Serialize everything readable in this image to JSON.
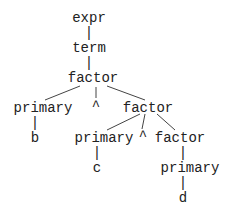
{
  "diagram": {
    "type": "parse-tree",
    "line_color": "#444444",
    "text_color": "#222222",
    "nodes": [
      {
        "id": "n0",
        "label": "expr",
        "x": 89,
        "y": 11
      },
      {
        "id": "n1",
        "label": "|",
        "x": 89,
        "y": 26
      },
      {
        "id": "n2",
        "label": "term",
        "x": 89,
        "y": 41
      },
      {
        "id": "n3",
        "label": "|",
        "x": 89,
        "y": 56
      },
      {
        "id": "n4",
        "label": "factor",
        "x": 93,
        "y": 71
      },
      {
        "id": "n5",
        "label": "primary",
        "x": 43,
        "y": 101
      },
      {
        "id": "n6",
        "label": "^",
        "x": 96,
        "y": 99
      },
      {
        "id": "n7",
        "label": "factor",
        "x": 148,
        "y": 101
      },
      {
        "id": "n8",
        "label": "|",
        "x": 35,
        "y": 116
      },
      {
        "id": "n9",
        "label": "b",
        "x": 35,
        "y": 131
      },
      {
        "id": "n10",
        "label": "primary",
        "x": 104,
        "y": 131
      },
      {
        "id": "n11",
        "label": "^",
        "x": 143,
        "y": 129
      },
      {
        "id": "n12",
        "label": "factor",
        "x": 180,
        "y": 131
      },
      {
        "id": "n13",
        "label": "|",
        "x": 97,
        "y": 146
      },
      {
        "id": "n14",
        "label": "c",
        "x": 97,
        "y": 161
      },
      {
        "id": "n15",
        "label": "|",
        "x": 183,
        "y": 146
      },
      {
        "id": "n16",
        "label": "primary",
        "x": 190,
        "y": 161
      },
      {
        "id": "n17",
        "label": "|",
        "x": 183,
        "y": 176
      },
      {
        "id": "n18",
        "label": "d",
        "x": 183,
        "y": 191
      }
    ],
    "edges": [
      {
        "from": "factor",
        "to": "primary",
        "x1": 80,
        "y1": 86,
        "x2": 45,
        "y2": 100
      },
      {
        "from": "factor",
        "to": "^",
        "x1": 96,
        "y1": 87,
        "x2": 96,
        "y2": 98
      },
      {
        "from": "factor",
        "to": "factor",
        "x1": 107,
        "y1": 86,
        "x2": 145,
        "y2": 100
      },
      {
        "from": "factor2",
        "to": "primary2",
        "x1": 140,
        "y1": 114,
        "x2": 107,
        "y2": 130
      },
      {
        "from": "factor2",
        "to": "^2",
        "x1": 145,
        "y1": 114,
        "x2": 142,
        "y2": 129
      },
      {
        "from": "factor2",
        "to": "factor3",
        "x1": 157,
        "y1": 114,
        "x2": 175,
        "y2": 130
      }
    ]
  }
}
